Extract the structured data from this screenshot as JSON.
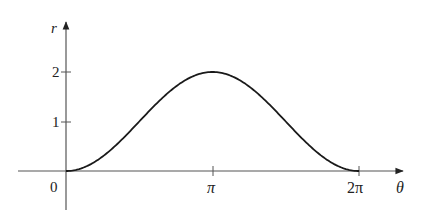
{
  "chart_data": {
    "type": "line",
    "title": "",
    "function": "r = 1 - cos(theta)",
    "xlabel": "θ",
    "ylabel": "r",
    "x_ticks": [
      {
        "value": 0,
        "label": "0"
      },
      {
        "value": 3.14159,
        "label": "π"
      },
      {
        "value": 6.28319,
        "label": "2π"
      }
    ],
    "y_ticks": [
      {
        "value": 1,
        "label": "1"
      },
      {
        "value": 2,
        "label": "2"
      }
    ],
    "xlim": [
      0,
      6.28319
    ],
    "ylim": [
      0,
      2
    ],
    "grid": false,
    "legend": null,
    "series": [
      {
        "name": "r(θ)",
        "x": [
          0,
          0.7854,
          1.5708,
          2.3562,
          3.14159,
          3.927,
          4.7124,
          5.4978,
          6.28319
        ],
        "values": [
          0,
          0.29,
          1.0,
          1.71,
          2.0,
          1.71,
          1.0,
          0.29,
          0
        ]
      }
    ],
    "colors": {
      "axis": "#555555",
      "curve": "#1a1a1a"
    }
  },
  "labels": {
    "y_axis": "r",
    "x_axis": "θ",
    "origin": "0",
    "pi": "π",
    "two_pi": "2π",
    "one": "1",
    "two": "2"
  }
}
